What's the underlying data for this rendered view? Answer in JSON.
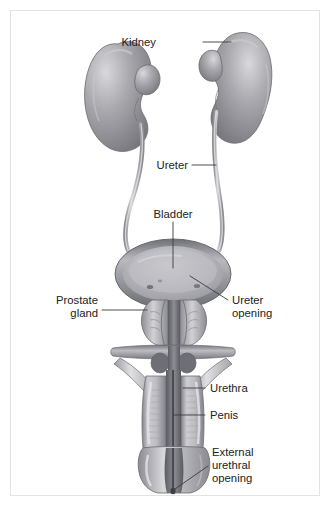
{
  "figure": {
    "background_color": "#ffffff",
    "frame_border_color": "#e3e3e3"
  },
  "labels": {
    "kidney": "Kidney",
    "ureter": "Ureter",
    "bladder": "Bladder",
    "prostate_line1": "Prostate",
    "prostate_line2": "gland",
    "ureter_opening_line1": "Ureter",
    "ureter_opening_line2": "opening",
    "urethra": "Urethra",
    "penis": "Penis",
    "external_opening_line1": "External",
    "external_opening_line2": "urethral",
    "external_opening_line3": "opening"
  },
  "colors": {
    "organ_mid": "#9a9a9e",
    "organ_light": "#d5d5d8",
    "organ_dark": "#6e6e74",
    "outline": "#6a6a70",
    "text": "#222222",
    "leader": "#3a3a42"
  },
  "structures": [
    {
      "name": "left-kidney",
      "label": "Kidney"
    },
    {
      "name": "right-kidney",
      "label": "Kidney"
    },
    {
      "name": "left-ureter",
      "label": "Ureter"
    },
    {
      "name": "right-ureter",
      "label": "Ureter"
    },
    {
      "name": "bladder",
      "label": "Bladder"
    },
    {
      "name": "ureter-opening",
      "label": "Ureter opening"
    },
    {
      "name": "prostate-gland",
      "label": "Prostate gland"
    },
    {
      "name": "urethra",
      "label": "Urethra"
    },
    {
      "name": "penis",
      "label": "Penis"
    },
    {
      "name": "glans-penis",
      "label": "Glans"
    },
    {
      "name": "external-urethral-opening",
      "label": "External urethral opening"
    }
  ]
}
